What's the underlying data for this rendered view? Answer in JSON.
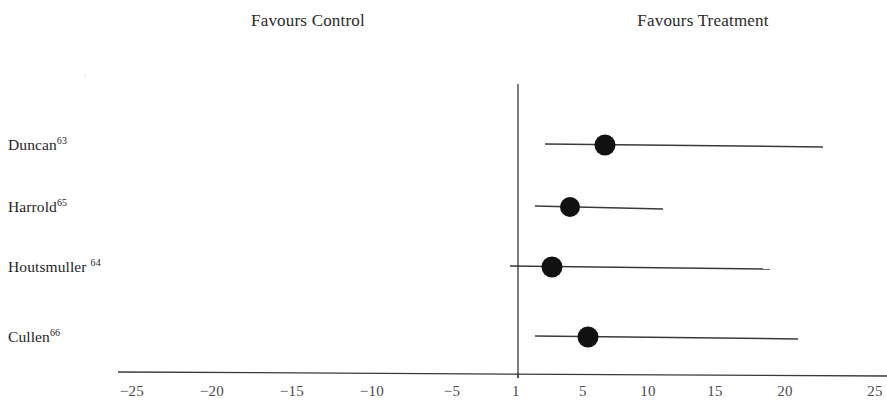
{
  "headers": {
    "left": "Favours Control",
    "right": "Favours Treatment"
  },
  "studies": [
    {
      "name": "Duncan",
      "superscript": "63",
      "space_before_sup": false
    },
    {
      "name": "Harrold",
      "superscript": "65",
      "space_before_sup": false
    },
    {
      "name": "Houtsmuller",
      "superscript": "64",
      "space_before_sup": true
    },
    {
      "name": "Cullen",
      "superscript": "66",
      "space_before_sup": false
    }
  ],
  "axis": {
    "tick_labels": [
      "−25",
      "−20",
      "−15",
      "−10",
      "−5",
      "1",
      "5",
      "10",
      "15",
      "20",
      "25"
    ],
    "tick_values": [
      -25,
      -20,
      -15,
      -10,
      -5,
      1,
      5,
      10,
      15,
      20,
      25
    ],
    "tick_x_px": [
      132,
      212,
      292,
      372,
      452,
      516,
      583,
      648,
      715,
      785,
      875
    ],
    "reference_line_value": 1,
    "reference_line_x_px": 518
  },
  "chart_data": {
    "type": "scatter",
    "subtype": "forest-plot",
    "title": "",
    "xlabel": "",
    "ylabel": "",
    "xlim": [
      -25,
      25
    ],
    "grid": false,
    "legend": null,
    "reference_line": 1,
    "left_annotation": "Favours Control",
    "right_annotation": "Favours Treatment",
    "categories": [
      "Duncan",
      "Harrold",
      "Houtsmuller",
      "Cullen"
    ],
    "values": [
      6.7,
      4.0,
      2.7,
      5.2
    ],
    "ci_low": [
      2.2,
      2.4,
      0.5,
      2.4
    ],
    "ci_high": [
      21.5,
      10.5,
      18.2,
      20.0
    ],
    "points": [
      {
        "label": "Duncan",
        "superscript": "63",
        "estimate": 6.7,
        "ci_low": 2.2,
        "ci_high": 21.5,
        "px": {
          "row_y": 145,
          "marker_x": 605,
          "line_x1": 545,
          "line_x2": 823,
          "marker_r": 10.5
        }
      },
      {
        "label": "Harrold",
        "superscript": "65",
        "estimate": 4.0,
        "ci_low": 2.4,
        "ci_high": 10.5,
        "px": {
          "row_y": 207,
          "marker_x": 570,
          "line_x1": 535,
          "line_x2": 663,
          "marker_r": 10.0
        }
      },
      {
        "label": "Houtsmuller",
        "superscript": "64",
        "estimate": 2.7,
        "ci_low": 0.5,
        "ci_high": 18.2,
        "px": {
          "row_y": 267,
          "marker_x": 552,
          "line_x1": 510,
          "line_x2": 770,
          "marker_r": 10.5
        }
      },
      {
        "label": "Cullen",
        "superscript": "66",
        "estimate": 5.2,
        "ci_low": 2.4,
        "ci_high": 20.0,
        "px": {
          "row_y": 337,
          "marker_x": 588,
          "line_x1": 535,
          "line_x2": 798,
          "marker_r": 10.5
        }
      }
    ]
  },
  "style": {
    "marker_color": "#111111",
    "line_color": "#3a3a3a",
    "axis_color": "#3a3a3a",
    "text_color": "#1f1f1f",
    "tick_text_color": "#4a4a55",
    "background": "#ffffff"
  },
  "geometry": {
    "width": 887,
    "height": 403,
    "axis_y": 374,
    "axis_x1": 118,
    "axis_x2": 887,
    "vline_y_top": 84,
    "vline_y_bottom": 378
  }
}
